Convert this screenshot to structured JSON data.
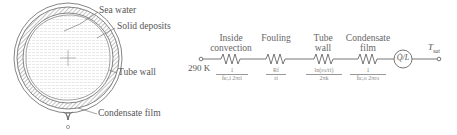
{
  "cross_section": {
    "labels": {
      "sea_water": "Sea water",
      "solid_deposits": "Solid deposits",
      "tube_wall": "Tube wall",
      "condensate_film": "Condensate film"
    }
  },
  "circuit": {
    "inlet_temperature": "290 K",
    "outlet_temperature": "T",
    "outlet_temperature_subscript": "sat",
    "heat_source": "Q̇/L",
    "resistances": [
      {
        "header_line1": "Inside",
        "header_line2": "convection",
        "numerator": "1",
        "denominator": "h̄c,i 2πri"
      },
      {
        "header_line1": "Fouling",
        "header_line2": "",
        "numerator": "Rf",
        "denominator": "ri"
      },
      {
        "header_line1": "Tube",
        "header_line2": "wall",
        "numerator": "ln(ro/ri)",
        "denominator": "2πk"
      },
      {
        "header_line1": "Condensate",
        "header_line2": "film",
        "numerator": "1",
        "denominator": "h̄c,o 2πro"
      }
    ]
  },
  "colors": {
    "line": "#666666",
    "hatch": "#888888",
    "fill": "#eeeeee"
  }
}
